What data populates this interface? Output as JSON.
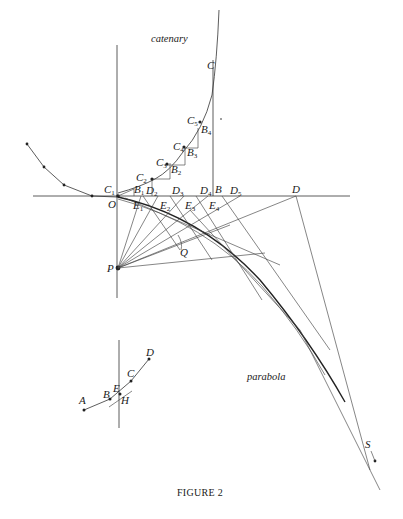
{
  "figure": {
    "caption": "FIGURE 2",
    "curve_labels": {
      "catenary": "catenary",
      "parabola": "parabola"
    },
    "points": {
      "C": "C",
      "C1": "C",
      "C1_sub": "1",
      "C2": "C",
      "C2_sub": "2",
      "C3": "C",
      "C3_sub": "3",
      "C4": "C",
      "C4_sub": "4",
      "C5": "C",
      "C5_sub": "5",
      "B": "B",
      "B1": "B",
      "B1_sub": "1",
      "B2": "B",
      "B2_sub": "2",
      "B3": "B",
      "B3_sub": "3",
      "B4": "B",
      "B4_sub": "4",
      "D": "D",
      "D2": "D",
      "D2_sub": "2",
      "D3": "D",
      "D3_sub": "3",
      "D4": "D",
      "D4_sub": "4",
      "D5": "D",
      "D5_sub": "5",
      "E1": "E",
      "E1_sub": "1",
      "E2": "E",
      "E2_sub": "2",
      "E3": "E",
      "E3_sub": "3",
      "E4": "E",
      "E4_sub": "4",
      "O": "O",
      "P": "P",
      "Q": "Q",
      "S": "S"
    },
    "inset_points": {
      "A": "A",
      "B": "B",
      "C": "C",
      "D": "D",
      "E": "E",
      "H": "H"
    },
    "colors": {
      "ink": "#222222",
      "paper": "#ffffff"
    }
  }
}
